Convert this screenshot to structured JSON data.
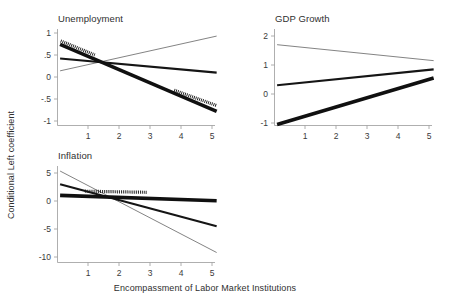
{
  "figure": {
    "xlabel": "Encompassment of Labor Market Institutions",
    "ylabel": "Conditional Left coefficient"
  },
  "chart_data": [
    {
      "type": "line",
      "title": "Unemployment",
      "xlabel": "Encompassment of Labor Market Institutions",
      "ylabel": "Conditional Left coefficient",
      "xlim": [
        0.1,
        5.25
      ],
      "ylim": [
        -1.0,
        1.0
      ],
      "xticks": [
        1,
        2,
        3,
        4,
        5
      ],
      "xticklabels": [
        "1",
        "2",
        "3",
        "4",
        "5"
      ],
      "yticks": [
        1,
        0.5,
        0,
        -0.5,
        -1
      ],
      "yticklabels": [
        "1",
        ".5",
        "0",
        "-.5",
        "-1"
      ],
      "grid": false,
      "legend": "none",
      "series": [
        {
          "name": "thick-line",
          "style": "thick",
          "x": [
            0.1,
            5.15
          ],
          "values": [
            0.74,
            -0.78
          ]
        },
        {
          "name": "medium-line",
          "style": "medium",
          "x": [
            0.1,
            5.15
          ],
          "values": [
            0.42,
            0.1
          ]
        },
        {
          "name": "thin-line",
          "style": "thin",
          "x": [
            0.1,
            5.15
          ],
          "values": [
            0.14,
            0.93
          ]
        },
        {
          "name": "significance-band-left",
          "style": "band",
          "x": [
            0.12,
            1.22
          ],
          "values": [
            0.82,
            0.5
          ]
        },
        {
          "name": "significance-band-right",
          "style": "band",
          "x": [
            3.78,
            5.15
          ],
          "values": [
            -0.3,
            -0.65
          ]
        }
      ]
    },
    {
      "type": "line",
      "title": "GDP Growth",
      "xlabel": "Encompassment of Labor Market Institutions",
      "ylabel": "Conditional Left coefficient",
      "xlim": [
        0.1,
        5.25
      ],
      "ylim": [
        -1.15,
        2.1
      ],
      "xticks": [
        1,
        2,
        3,
        4,
        5
      ],
      "xticklabels": [
        "1",
        "2",
        "3",
        "4",
        "5"
      ],
      "yticks": [
        2,
        1,
        0,
        -1
      ],
      "yticklabels": [
        "2",
        "1",
        "0",
        "-1"
      ],
      "grid": false,
      "legend": "none",
      "series": [
        {
          "name": "thin-line",
          "style": "thin",
          "x": [
            0.1,
            5.15
          ],
          "values": [
            1.7,
            1.15
          ]
        },
        {
          "name": "medium-line",
          "style": "medium",
          "x": [
            0.1,
            5.15
          ],
          "values": [
            0.3,
            0.85
          ]
        },
        {
          "name": "thick-line",
          "style": "thick",
          "x": [
            0.1,
            5.15
          ],
          "values": [
            -1.05,
            0.55
          ]
        }
      ]
    },
    {
      "type": "line",
      "title": "Inflation",
      "xlabel": "Encompassment of Labor Market Institutions",
      "ylabel": "Conditional Left coefficient",
      "xlim": [
        0.1,
        5.25
      ],
      "ylim": [
        -11.5,
        6.2
      ],
      "xticks": [
        1,
        2,
        3,
        4,
        5
      ],
      "xticklabels": [
        "1",
        "2",
        "3",
        "4",
        "5"
      ],
      "yticks": [
        5,
        0,
        -5,
        -10
      ],
      "yticklabels": [
        "5",
        "0",
        "-5",
        "-10"
      ],
      "grid": false,
      "legend": "none",
      "series": [
        {
          "name": "thin-line",
          "style": "thin",
          "x": [
            0.1,
            5.15
          ],
          "values": [
            5.35,
            -9.2
          ]
        },
        {
          "name": "medium-line",
          "style": "medium",
          "x": [
            0.1,
            5.15
          ],
          "values": [
            3.0,
            -4.5
          ]
        },
        {
          "name": "thick-line",
          "style": "thick",
          "x": [
            0.1,
            5.15
          ],
          "values": [
            1.0,
            0.05
          ]
        },
        {
          "name": "significance-band",
          "style": "band",
          "x": [
            0.9,
            2.92
          ],
          "values": [
            1.75,
            1.55
          ]
        }
      ]
    }
  ]
}
